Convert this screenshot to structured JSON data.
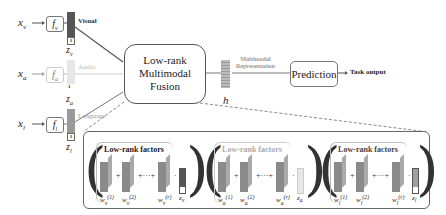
{
  "inputs": [
    {
      "x": "x_v",
      "x_main": "x",
      "x_sub": "v",
      "f_main": "f",
      "f_sub": "v",
      "z_main": "z",
      "z_sub": "v",
      "label": "Visual",
      "color": "#555555",
      "label_color": "#333333"
    },
    {
      "x": "x_a",
      "x_main": "x",
      "x_sub": "a",
      "f_main": "f",
      "f_sub": "a",
      "z_main": "z",
      "z_sub": "a",
      "label": "Audio",
      "color": "#e4e4e4",
      "label_color": "#bbbbbb"
    },
    {
      "x": "x_l",
      "x_main": "x",
      "x_sub": "l",
      "f_main": "f",
      "f_sub": "l",
      "z_main": "z",
      "z_sub": "l",
      "label": "Language",
      "color": "#9a9a9a",
      "label_color": "#999999"
    }
  ],
  "one_label": "1",
  "fusion_box": {
    "line1": "Low-rank",
    "line2": "Multimodal",
    "line3": "Fusion"
  },
  "representation": {
    "vector_label": "h",
    "caption_line1": "Multimodal",
    "caption_line2": "Representation"
  },
  "prediction_box": {
    "label": "Prediction"
  },
  "task_output": "Task output",
  "expansion": {
    "groups": [
      {
        "title": "Low-rank factors",
        "title_color": "#555555",
        "sub": "v",
        "factor_color": "#8a8a8a",
        "z_label": "z",
        "vec_color": "#555555",
        "w1": "w",
        "w2": "w",
        "wr": "w",
        "sup1": "(1)",
        "sup2": "(2)",
        "supr": "(r)"
      },
      {
        "title": "Low-rank factors",
        "title_color": "#aaaaaa",
        "sub": "a",
        "factor_color": "#8a8a8a",
        "z_label": "z",
        "vec_color": "#e6e6e6",
        "w1": "w",
        "w2": "w",
        "wr": "w",
        "sup1": "(1)",
        "sup2": "(2)",
        "supr": "(r)"
      },
      {
        "title": "Low-rank factors",
        "title_color": "#444444",
        "sub": "l",
        "factor_color": "#8a8a8a",
        "z_label": "z",
        "vec_color": "#a0a0a0",
        "w1": "w",
        "w2": "w",
        "wr": "w",
        "sup1": "(1)",
        "sup2": "(2)",
        "supr": "(r)"
      }
    ],
    "plus": "+",
    "ellipsis": "+···+",
    "dot": "·",
    "between": "∘"
  }
}
